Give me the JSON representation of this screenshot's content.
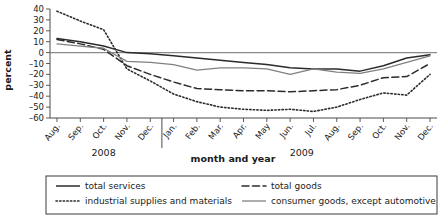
{
  "chart_data": {
    "type": "line",
    "title": "",
    "xlabel": "month and year",
    "ylabel": "percent",
    "ylim": [
      -60,
      40
    ],
    "yticks": [
      40,
      30,
      20,
      10,
      0,
      -10,
      -20,
      -30,
      -40,
      -50,
      -60
    ],
    "ytick_labels": [
      "40",
      "30",
      "20",
      "10",
      "0",
      "–10",
      "–20",
      "–30",
      "–40",
      "–50",
      "–60"
    ],
    "grid": false,
    "zero_line": true,
    "legend_position": "bottom",
    "x": [
      "Aug.",
      "Sep.",
      "Oct.",
      "Nov.",
      "Dec.",
      "Jan.",
      "Feb.",
      "Mar.",
      "Apr.",
      "May",
      "Jun.",
      "Jul.",
      "Aug.",
      "Sep.",
      "Oct.",
      "Nov.",
      "Dec."
    ],
    "x_groups": [
      {
        "label": "2008",
        "start": 0,
        "end": 4
      },
      {
        "label": "2009",
        "start": 5,
        "end": 16
      }
    ],
    "series": [
      {
        "name": "total services",
        "style": "solid",
        "color": "#2b2b2b",
        "width": 1.5,
        "values": [
          13,
          10,
          6,
          0,
          -1,
          -3,
          -5,
          -7,
          -9,
          -11,
          -14,
          -15,
          -15,
          -17,
          -12,
          -5,
          -2
        ]
      },
      {
        "name": "total goods",
        "style": "dashed",
        "color": "#2b2b2b",
        "width": 1.5,
        "values": [
          12,
          8,
          3,
          -12,
          -20,
          -27,
          -33,
          -34,
          -35,
          -35,
          -36,
          -35,
          -34,
          -30,
          -23,
          -22,
          -10
        ]
      },
      {
        "name": "industrial supplies and materials",
        "style": "dotted",
        "color": "#2b2b2b",
        "width": 1.6,
        "values": [
          38,
          29,
          21,
          -15,
          -26,
          -38,
          -45,
          -50,
          -52,
          -53,
          -52,
          -54,
          -50,
          -43,
          -37,
          -39,
          -20
        ]
      },
      {
        "name": "consumer goods, except automotive",
        "style": "solid-gray",
        "color": "#808080",
        "width": 1.3,
        "values": [
          8,
          6,
          4,
          -8,
          -9,
          -11,
          -16,
          -14,
          -14,
          -15,
          -20,
          -15,
          -18,
          -19,
          -15,
          -9,
          -3
        ]
      }
    ]
  },
  "legend": {
    "entries": [
      {
        "label": "total services",
        "style": "solid"
      },
      {
        "label": "total goods",
        "style": "dashed"
      },
      {
        "label": "industrial supplies and materials",
        "style": "dotted"
      },
      {
        "label": "consumer goods, except automotive",
        "style": "solid-gray"
      }
    ]
  }
}
